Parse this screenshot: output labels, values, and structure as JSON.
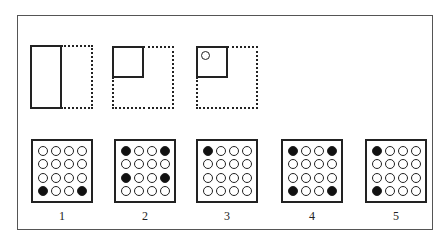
{
  "puzzle": {
    "type": "paper-folding",
    "steps": [
      {
        "id": "fold-1",
        "description": "rectangle folded right half over left"
      },
      {
        "id": "fold-2",
        "description": "square folded top-left quadrant"
      },
      {
        "id": "punch",
        "description": "hole punched in top-left of folded square"
      }
    ]
  },
  "options": [
    {
      "label": "1",
      "grid": [
        [
          0,
          0,
          0,
          0
        ],
        [
          0,
          0,
          0,
          0
        ],
        [
          0,
          0,
          0,
          0
        ],
        [
          1,
          0,
          0,
          1
        ]
      ]
    },
    {
      "label": "2",
      "grid": [
        [
          1,
          0,
          0,
          1
        ],
        [
          0,
          0,
          0,
          0
        ],
        [
          1,
          0,
          0,
          1
        ],
        [
          0,
          0,
          0,
          0
        ]
      ]
    },
    {
      "label": "3",
      "grid": [
        [
          1,
          0,
          0,
          0
        ],
        [
          0,
          0,
          0,
          0
        ],
        [
          0,
          0,
          0,
          0
        ],
        [
          0,
          0,
          0,
          0
        ]
      ]
    },
    {
      "label": "4",
      "grid": [
        [
          1,
          0,
          0,
          1
        ],
        [
          0,
          0,
          0,
          0
        ],
        [
          0,
          0,
          0,
          0
        ],
        [
          1,
          0,
          0,
          1
        ]
      ]
    },
    {
      "label": "5",
      "grid": [
        [
          1,
          0,
          0,
          0
        ],
        [
          0,
          0,
          0,
          0
        ],
        [
          0,
          0,
          0,
          0
        ],
        [
          1,
          0,
          0,
          0
        ]
      ]
    }
  ],
  "colors": {
    "ink": "#222222",
    "background": "#ffffff"
  }
}
